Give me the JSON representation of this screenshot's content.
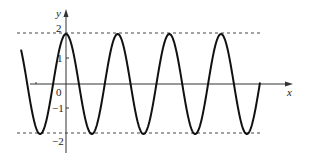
{
  "chart_data": {
    "type": "line",
    "title": "",
    "xlabel": "x",
    "ylabel": "y",
    "origin_label": "0",
    "y_ticks": [
      {
        "value": 2,
        "label": "2"
      },
      {
        "value": 1,
        "label": "1"
      },
      {
        "value": -1,
        "label": "−1"
      },
      {
        "value": -2,
        "label": "−2"
      }
    ],
    "ylim": [
      -2,
      2
    ],
    "grid": false,
    "legend": null,
    "reference_lines": [
      {
        "y": 2,
        "style": "dashed"
      },
      {
        "y": -2,
        "style": "dashed"
      }
    ],
    "series": [
      {
        "name": "y = 2cos(ωx)",
        "amplitude": 2,
        "peaks_x_px": [
          66,
          117,
          169,
          221
        ],
        "troughs_x_px": [
          40,
          92,
          143,
          195,
          247
        ],
        "description": "Cosine wave of amplitude 2 with maximum 2 at x=0, about 4.6 periods shown"
      }
    ]
  },
  "layout": {
    "axis_color": "#333333",
    "curve_color": "#111111",
    "dash_color": "#444444"
  }
}
